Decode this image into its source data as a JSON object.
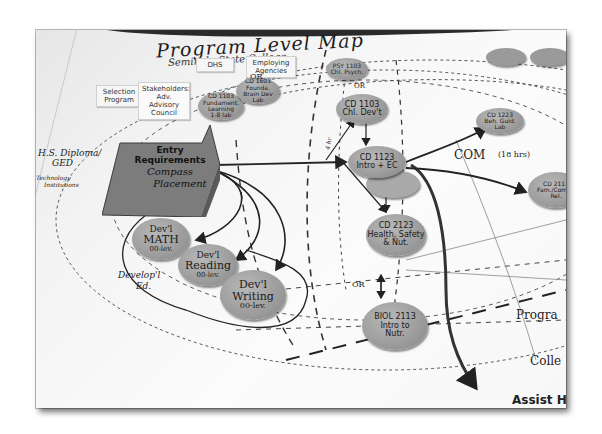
{
  "poster": {
    "title": "Program Level Map",
    "subtitle": "Seminole State College"
  },
  "top_cards": [
    {
      "label": "DHS"
    },
    {
      "label": "Employing Agencies"
    },
    {
      "label": "Selection Program"
    },
    {
      "label": "Stakeholders: Adv. Advisory Council"
    }
  ],
  "entry": {
    "line1": "Entry",
    "line2": "Requirements",
    "line3": "Compass",
    "line4": "Placement"
  },
  "left_notes": {
    "diploma": "H.S. Diploma/",
    "ged": "GED",
    "tech1": "Technology",
    "tech2": "Institutions",
    "dev_ed1": "Develop'l",
    "dev_ed2": "Ed."
  },
  "dev_nodes": [
    {
      "line1": "Dev'l",
      "line2": "MATH",
      "line3": "00-lev."
    },
    {
      "line1": "Dev'l",
      "line2": "Reading",
      "line3": "00-lev."
    },
    {
      "line1": "Dev'l",
      "line2": "Writing",
      "line3": "00-lev."
    }
  ],
  "upper_nodes": [
    {
      "line1": "CD 1103",
      "line2": "Fundament.",
      "line3": "Learning",
      "line4": "1-8 lab"
    },
    {
      "line1": "CD 1603",
      "line2": "Founda.",
      "line3": "Brain Dev",
      "line4": "Lab"
    },
    {
      "line1": "PSY 1103",
      "line2": "Chl. Psych."
    }
  ],
  "core_nodes": [
    {
      "line1": "CD 1103",
      "line2": "Chl. Dev't"
    },
    {
      "line1": "CD 1123",
      "line2": "Intro + EC"
    },
    {
      "line1": "CD 2123",
      "line2": "Health, Safety",
      "line3": "& Nut."
    },
    {
      "line1": "BIOL 2113",
      "line2": "Intro to",
      "line3": "Nutr."
    }
  ],
  "right_nodes": [
    {
      "line1": "CD 1223",
      "line2": "Beh. Guid.",
      "line3": "Lab"
    },
    {
      "line1": "CD 2113",
      "line2": "Fam./Comm.",
      "line3": "Rel."
    }
  ],
  "annotations": {
    "or_top": "OR",
    "or_mid": "OR",
    "or_bottom": "OR",
    "com": "COM",
    "com_hrs": "(18 hrs)",
    "side_label": "4 hr",
    "program": "Progra",
    "college": "Colle",
    "bottom_label": "Assist HS"
  },
  "colors": {
    "node_fill": "#9e9e9e",
    "entry_fill": "#7c7c7c",
    "paper": "#f7f7f7",
    "ink": "#222222"
  }
}
